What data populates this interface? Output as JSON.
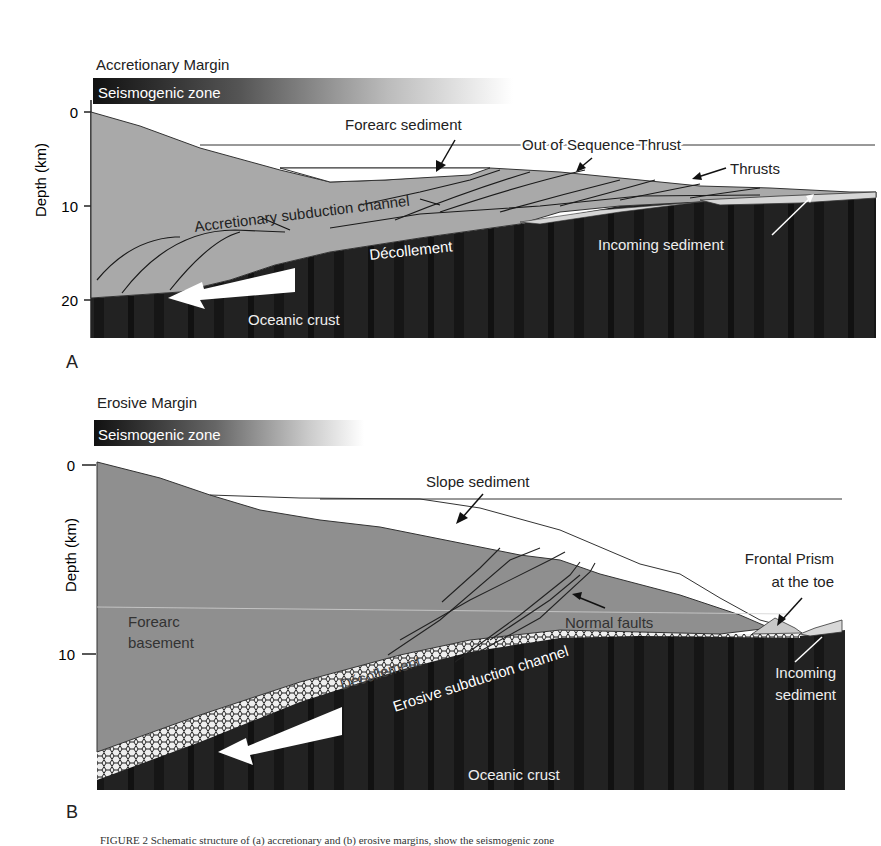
{
  "panels": [
    {
      "letter": "A",
      "title": "Accretionary Margin",
      "seismogenic_label": "Seismogenic zone",
      "y_axis": {
        "label": "Depth (km)",
        "ticks": [
          "0",
          "10",
          "20"
        ]
      },
      "labels": {
        "forearc_sediment": "Forearc sediment",
        "out_of_sequence_thrust": "Out of Sequence Thrust",
        "thrusts": "Thrusts",
        "accretionary_subduction_channel": "Accretionary subduction channel",
        "decollement": "Décollement",
        "incoming_sediment": "Incoming sediment",
        "oceanic_crust": "Oceanic crust"
      }
    },
    {
      "letter": "B",
      "title": "Erosive Margin",
      "seismogenic_label": "Seismogenic zone",
      "y_axis": {
        "label": "Depth (km)",
        "ticks": [
          "0",
          "10"
        ]
      },
      "labels": {
        "slope_sediment": "Slope sediment",
        "frontal_prism_1": "Frontal Prism",
        "frontal_prism_2": "at the toe",
        "forearc_basement_1": "Forearc",
        "forearc_basement_2": "basement",
        "normal_faults": "Normal faults",
        "decollement": "Décollement",
        "erosive_subduction_channel": "Erosive subduction channel",
        "incoming_sediment_1": "Incoming",
        "incoming_sediment_2": "sediment",
        "oceanic_crust": "Oceanic crust"
      }
    }
  ],
  "colors": {
    "forearc_light": "#a9a9a9",
    "forearc_dark": "#8c8c8c",
    "oceanic_crust": "#1c1c1c",
    "incoming_sediment": "#d0d0d0",
    "line": "#1a1a1a"
  },
  "caption": "FIGURE 2  Schematic structure of (a) accretionary and (b) erosive margins, show the seismogenic zone"
}
